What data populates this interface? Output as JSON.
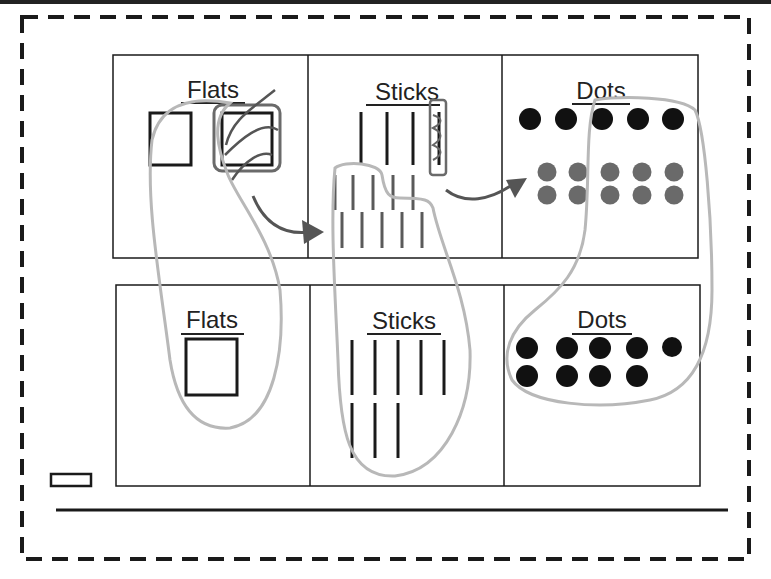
{
  "diagram": {
    "top_row": {
      "cells": [
        {
          "label": "Flats",
          "content": "two squares (one circled and crossed out)"
        },
        {
          "label": "Sticks",
          "content": "3 long sticks + 1 circled stick, 10 short sticks below"
        },
        {
          "label": "Dots",
          "content": "5 black dots, 10 grey dots"
        }
      ]
    },
    "bottom_row": {
      "cells": [
        {
          "label": "Flats",
          "content": "1 square"
        },
        {
          "label": "Sticks",
          "content": "8 sticks"
        },
        {
          "label": "Dots",
          "content": "9 black dots"
        }
      ]
    },
    "colors": {
      "ink": "#1a1a1a",
      "grey_marks": "#5a5a5a",
      "loop": "#b8b8b8",
      "arrow": "#555555",
      "dashed_border": "#1a1a1a"
    }
  }
}
